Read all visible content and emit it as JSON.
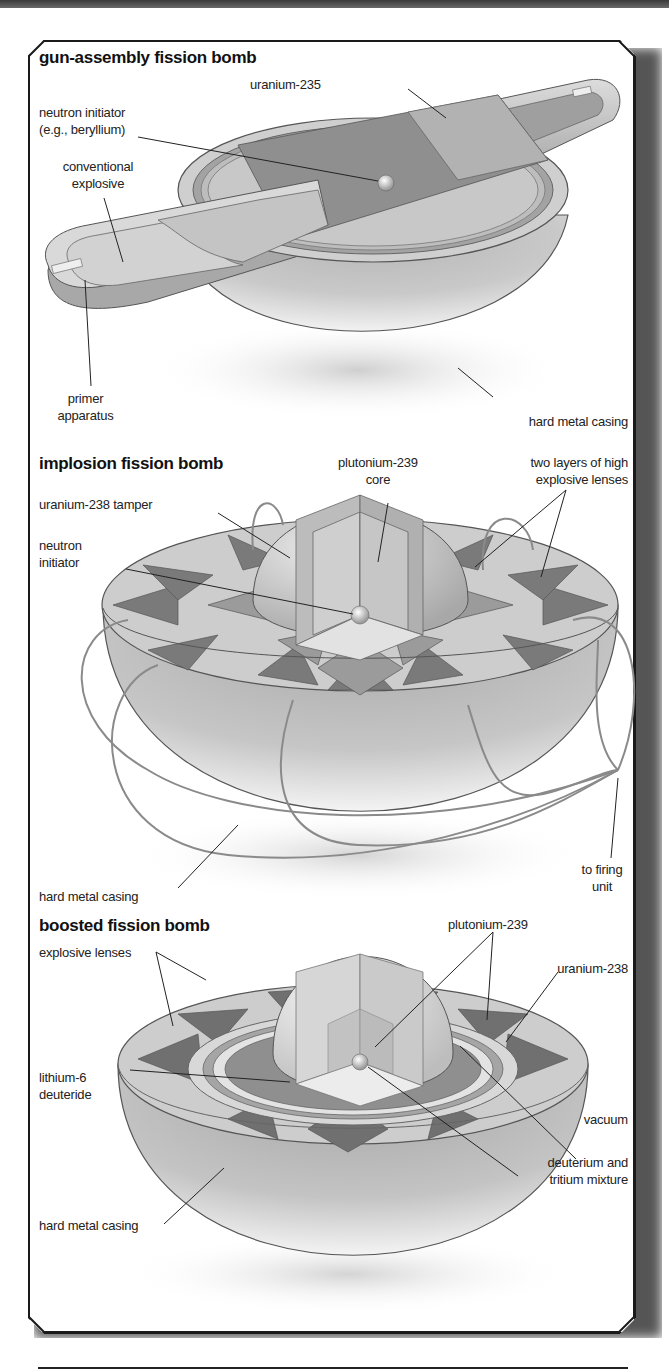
{
  "figure": {
    "sections": [
      {
        "title": "gun-assembly fission bomb",
        "labels": {
          "uranium_235": "uranium-235",
          "neutron_initiator_line1": "neutron initiator",
          "neutron_initiator_line2": "(e.g., beryllium)",
          "conventional_explosive_line1": "conventional",
          "conventional_explosive_line2": "explosive",
          "primer_apparatus_line1": "primer",
          "primer_apparatus_line2": "apparatus",
          "hard_metal_casing": "hard metal casing"
        }
      },
      {
        "title": "implosion fission bomb",
        "labels": {
          "plutonium_core_line1": "plutonium-239",
          "plutonium_core_line2": "core",
          "explosive_lenses_line1": "two layers of high",
          "explosive_lenses_line2": "explosive lenses",
          "tamper": "uranium-238 tamper",
          "neutron_initiator_line1": "neutron",
          "neutron_initiator_line2": "initiator",
          "hard_metal_casing": "hard metal casing",
          "firing_unit_line1": "to firing",
          "firing_unit_line2": "unit"
        }
      },
      {
        "title": "boosted fission bomb",
        "labels": {
          "plutonium_239": "plutonium-239",
          "explosive_lenses": "explosive lenses",
          "uranium_238": "uranium-238",
          "lithium_line1": "lithium-6",
          "lithium_line2": "deuteride",
          "vacuum": "vacuum",
          "dt_mixture_line1": "deuterium and",
          "dt_mixture_line2": "tritium mixture",
          "hard_metal_casing": "hard metal casing"
        }
      }
    ],
    "colors": {
      "casing_light": "#e6e6e6",
      "casing_mid": "#bdbdbd",
      "casing_dark": "#9a9a9a",
      "lens_light": "#cfcfcf",
      "lens_dark": "#6f6f6f",
      "core": "#d9d9d9",
      "outline": "#444444",
      "text": "#222222"
    }
  }
}
